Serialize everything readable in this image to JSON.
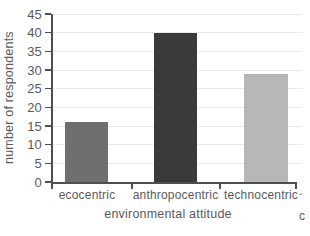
{
  "chart_data": {
    "type": "bar",
    "title": "",
    "categories": [
      "ecocentric",
      "anthropocentric",
      "technocentric"
    ],
    "values": [
      16,
      40,
      29
    ],
    "bar_colors": [
      "#6f6f6f",
      "#3a3a3a",
      "#b7b7b7"
    ],
    "xlabel": "environmental attitude",
    "ylabel": "number of respondents",
    "ylim": [
      0,
      45
    ],
    "yticks": [
      0,
      5,
      10,
      15,
      20,
      25,
      30,
      35,
      40,
      45
    ],
    "grid": "horizontal",
    "legend": "none",
    "axis_color": "#4f4f4f",
    "grid_color": "#e9e9e9",
    "text_color": "#5a5a5a",
    "background_color": "#ffffff"
  },
  "edge_fragments": {
    "dot": ".",
    "partial_char": "c"
  }
}
